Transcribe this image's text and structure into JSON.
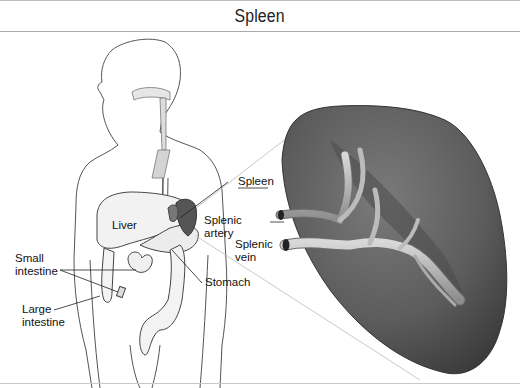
{
  "header": {
    "title": "Spleen"
  },
  "labels": {
    "liver": "Liver",
    "small_intestine_1": "Small",
    "small_intestine_2": "intestine",
    "large_intestine_1": "Large",
    "large_intestine_2": "intestine",
    "stomach": "Stomach",
    "spleen": "Spleen",
    "splenic_artery_1": "Splenic",
    "splenic_artery_2": "artery",
    "splenic_vein_1": "Splenic",
    "splenic_vein_2": "vein"
  },
  "colors": {
    "spleen_fill": "#5f5f5f",
    "spleen_dark": "#3c3c3c",
    "vessel": "#b5b5b5",
    "outline": "#333333"
  }
}
